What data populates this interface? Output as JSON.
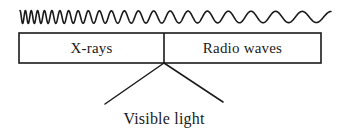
{
  "figure": {
    "kind": "electromagnetic-spectrum-diagram",
    "background_color": "#ffffff",
    "stroke_color": "#1a1a1a",
    "text_color": "#1a1a1a"
  },
  "waveform": {
    "name": "frequency-gradient-wave",
    "description": "sinusoid whose wavelength increases from left to right",
    "x_start": 20,
    "x_end": 331,
    "center_y": 17,
    "amplitude_left": 6.5,
    "amplitude_right": 5.5,
    "wavelength_left": 5.2,
    "wavelength_right": 30.0,
    "stroke_width": 1.6
  },
  "spectrum_bar": {
    "name": "spectrum-bar",
    "x": 19,
    "y": 33,
    "width": 302,
    "height": 30,
    "stroke_width": 1.6,
    "divider_x": 164,
    "cells": [
      {
        "id": "x-rays",
        "label": "X-rays"
      },
      {
        "id": "radio-waves",
        "label": "Radio waves"
      }
    ]
  },
  "callout": {
    "name": "visible-light-callout",
    "label": "Visible light",
    "apex_x": 164,
    "apex_y": 63,
    "left_end_x": 105,
    "left_end_y": 104,
    "right_end_x": 223,
    "right_end_y": 102,
    "stroke_width": 1.5
  }
}
